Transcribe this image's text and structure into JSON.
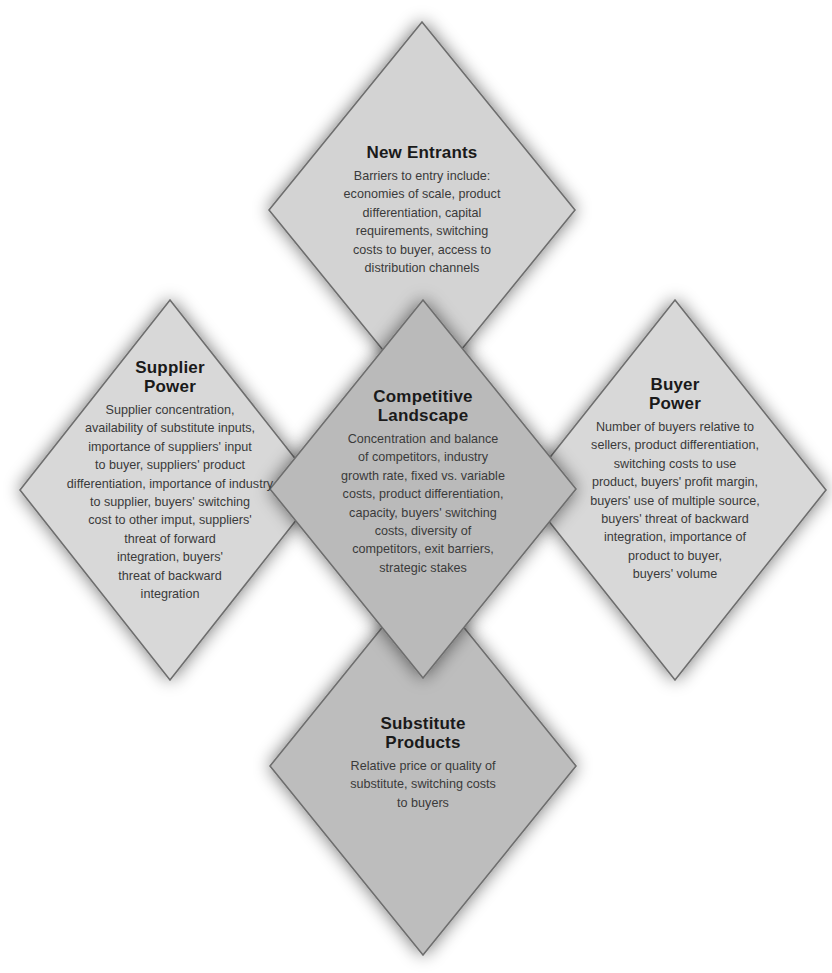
{
  "diagram": {
    "type": "five-forces-diamond",
    "colors": {
      "outer_fill": "#d6d6d6",
      "center_fill": "#bababa",
      "bottom_fill": "#bdbdbd",
      "stroke": "#6e6e6e",
      "title_text": "#1a1a1a",
      "body_text": "#3a3a3a"
    },
    "forces": {
      "new_entrants": {
        "title": "New Entrants",
        "body": "Barriers to entry include:\neconomies of scale, product\ndifferentiation, capital\nrequirements, switching\ncosts to buyer, access to\ndistribution channels"
      },
      "supplier_power": {
        "title": "Supplier\nPower",
        "body": "Supplier concentration,\navailability of substitute inputs,\nimportance of suppliers' input\nto buyer, suppliers' product\ndifferentiation, importance of industry\nto supplier, buyers' switching\ncost to other imput, suppliers'\nthreat of forward\nintegration, buyers'\nthreat of backward\nintegration"
      },
      "competitive_landscape": {
        "title": "Competitive\nLandscape",
        "body": "Concentration and balance\nof competitors, industry\ngrowth rate, fixed vs. variable\ncosts, product differentiation,\ncapacity, buyers' switching\ncosts, diversity of\ncompetitors, exit barriers,\nstrategic stakes"
      },
      "buyer_power": {
        "title": "Buyer\nPower",
        "body": "Number of buyers relative to\nsellers, product differentiation,\nswitching costs to use\nproduct, buyers' profit margin,\nbuyers' use of multiple source,\nbuyers' threat of backward\nintegration, importance of\nproduct to buyer,\nbuyers' volume"
      },
      "substitute_products": {
        "title": "Substitute\nProducts",
        "body": "Relative price or quality of\nsubstitute, switching costs\nto buyers"
      }
    }
  }
}
